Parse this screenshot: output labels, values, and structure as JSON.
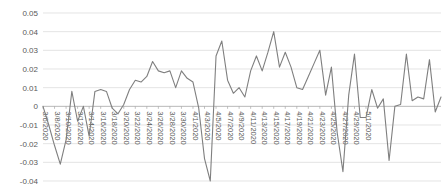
{
  "chart_data": {
    "type": "line",
    "title": "",
    "subtitle": "",
    "xlabel": "",
    "ylabel": "",
    "ylim": [
      -0.04,
      0.05
    ],
    "ytick_values": [
      0.05,
      0.04,
      0.03,
      0.02,
      0.01,
      0,
      -0.01,
      -0.02,
      -0.03,
      -0.04
    ],
    "ytick_labels": [
      "0.05",
      "0.04",
      "0.03",
      "0.02",
      "0.01",
      "0",
      "-0.01",
      "-0.02",
      "-0.03",
      "-0.04"
    ],
    "grid": true,
    "legend": null,
    "legend_position": "none",
    "line_color": "#7f7f7f",
    "gridline_color": "#d9d9d9",
    "xtick_labels": [
      "3/6/2020",
      "3/8/2020",
      "3/10/2020",
      "3/12/2020",
      "3/14/2020",
      "3/16/2020",
      "3/18/2020",
      "3/20/2020",
      "3/22/2020",
      "3/24/2020",
      "3/26/2020",
      "3/28/2020",
      "3/30/2020",
      "4/1/2020",
      "4/3/2020",
      "4/5/2020",
      "4/7/2020",
      "4/9/2020",
      "4/11/2020",
      "4/13/2020",
      "4/15/2020",
      "4/17/2020",
      "4/19/2020",
      "4/21/2020",
      "4/23/2020",
      "4/25/2020",
      "4/27/2020",
      "4/29/2020",
      "5/1/2020"
    ],
    "xtick_rotation": 90,
    "x": [
      "3/6/2020",
      "3/7/2020",
      "3/8/2020",
      "3/9/2020",
      "3/10/2020",
      "3/11/2020",
      "3/12/2020",
      "3/13/2020",
      "3/14/2020",
      "3/15/2020",
      "3/16/2020",
      "3/17/2020",
      "3/18/2020",
      "3/19/2020",
      "3/20/2020",
      "3/21/2020",
      "3/22/2020",
      "3/23/2020",
      "3/24/2020",
      "3/25/2020",
      "3/26/2020",
      "3/27/2020",
      "3/28/2020",
      "3/29/2020",
      "3/30/2020",
      "3/31/2020",
      "4/1/2020",
      "4/2/2020",
      "4/3/2020",
      "4/4/2020",
      "4/5/2020",
      "4/6/2020",
      "4/7/2020",
      "4/8/2020",
      "4/9/2020",
      "4/10/2020",
      "4/11/2020",
      "4/12/2020",
      "4/13/2020",
      "4/14/2020",
      "4/15/2020",
      "4/16/2020",
      "4/17/2020",
      "4/18/2020",
      "4/19/2020",
      "4/20/2020",
      "4/21/2020",
      "4/22/2020",
      "4/23/2020",
      "4/24/2020",
      "4/25/2020",
      "4/26/2020",
      "4/27/2020",
      "4/28/2020",
      "4/29/2020",
      "4/30/2020",
      "5/1/2020",
      "5/2/2020"
    ],
    "values": [
      0.0,
      -0.01,
      -0.021,
      -0.031,
      -0.018,
      0.008,
      -0.008,
      0.0,
      -0.016,
      0.008,
      0.009,
      0.008,
      -0.001,
      -0.004,
      0.001,
      0.009,
      0.014,
      0.013,
      0.016,
      0.024,
      0.019,
      0.018,
      0.019,
      0.01,
      0.019,
      0.015,
      0.013,
      -0.001,
      -0.028,
      -0.04,
      0.027,
      0.035,
      0.014,
      0.007,
      0.01,
      0.005,
      0.019,
      0.027,
      0.019,
      0.029,
      0.04,
      0.021,
      0.029,
      0.021,
      0.01,
      0.009,
      0.016,
      0.023,
      0.03,
      0.006,
      0.021,
      -0.014,
      -0.035,
      0.006,
      0.028,
      -0.006,
      -0.006,
      0.009
    ],
    "values_tail": [
      -0.001,
      0.004,
      -0.029,
      0.0,
      0.001,
      0.028,
      0.003,
      0.005,
      0.004,
      0.025,
      -0.003,
      0.005
    ]
  }
}
